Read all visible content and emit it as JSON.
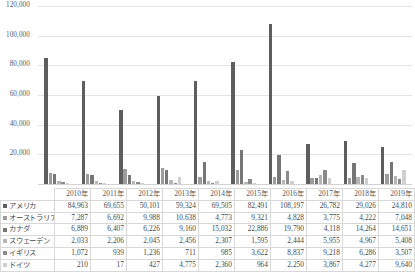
{
  "chart_data": {
    "type": "bar",
    "title": "",
    "xlabel": "",
    "ylabel": "",
    "ylim": [
      0,
      120000
    ],
    "yticks": [
      0,
      20000,
      40000,
      60000,
      80000,
      100000,
      120000
    ],
    "ytick_labels": [
      "",
      "20,000",
      "40,000",
      "60,000",
      "80,000",
      "100,000",
      "120,000"
    ],
    "grid": true,
    "legend_position": "table-row-headers",
    "categories": [
      "2010年",
      "2011年",
      "2012年",
      "2013年",
      "2014年",
      "2015年",
      "2016年",
      "2017年",
      "2018年",
      "2019年"
    ],
    "series": [
      {
        "name": "アメリカ",
        "color": "#5e5e5e",
        "values": [
          84963,
          69655,
          50101,
          59324,
          69505,
          82491,
          108197,
          26782,
          29026,
          24810
        ]
      },
      {
        "name": "オーストラリア",
        "color": "#9c9c9c",
        "values": [
          7287,
          6692,
          9988,
          10638,
          4773,
          9321,
          4828,
          3775,
          4222,
          7048
        ]
      },
      {
        "name": "カナダ",
        "color": "#767676",
        "values": [
          6889,
          6407,
          6226,
          9160,
          15032,
          22886,
          19790,
          4118,
          14264,
          14651
        ]
      },
      {
        "name": "スウェーデン",
        "color": "#b5b5b5",
        "values": [
          2033,
          2206,
          2045,
          2456,
          2307,
          1595,
          2444,
          5955,
          4967,
          5408
        ]
      },
      {
        "name": "イギリス",
        "color": "#8a8a8a",
        "values": [
          1072,
          939,
          1236,
          711,
          985,
          3622,
          8837,
          9218,
          6286,
          3507
        ]
      },
      {
        "name": "ドイツ",
        "color": "#cfcfcf",
        "values": [
          210,
          17,
          427,
          4775,
          2360,
          964,
          2250,
          3867,
          4277,
          9640
        ]
      }
    ]
  },
  "table": {
    "corner_label": "",
    "column_headers": [
      "2010年",
      "2011年",
      "2012年",
      "2013年",
      "2014年",
      "2015年",
      "2016年",
      "2017年",
      "2018年",
      "2019年"
    ],
    "rows": [
      {
        "label": "アメリカ",
        "cells": [
          "84,963",
          "69,655",
          "50,101",
          "59,324",
          "69,505",
          "82,491",
          "108,197",
          "26,782",
          "29,026",
          "24,810"
        ]
      },
      {
        "label": "オーストラリア",
        "cells": [
          "7,287",
          "6,692",
          "9,988",
          "10,638",
          "4,773",
          "9,321",
          "4,828",
          "3,775",
          "4,222",
          "7,048"
        ]
      },
      {
        "label": "カナダ",
        "cells": [
          "6,889",
          "6,407",
          "6,226",
          "9,160",
          "15,032",
          "22,886",
          "19,790",
          "4,118",
          "14,264",
          "14,651"
        ]
      },
      {
        "label": "スウェーデン",
        "cells": [
          "2,033",
          "2,206",
          "2,045",
          "2,456",
          "2,307",
          "1,595",
          "2,444",
          "5,955",
          "4,967",
          "5,408"
        ]
      },
      {
        "label": "イギリス",
        "cells": [
          "1,072",
          "939",
          "1,236",
          "711",
          "985",
          "3,622",
          "8,837",
          "9,218",
          "6,286",
          "3,507"
        ]
      },
      {
        "label": "ドイツ",
        "cells": [
          "210",
          "17",
          "427",
          "4,775",
          "2,360",
          "964",
          "2,250",
          "3,867",
          "4,277",
          "9,640"
        ]
      }
    ]
  }
}
